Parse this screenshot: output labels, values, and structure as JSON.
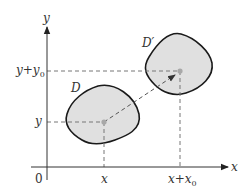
{
  "diagram": {
    "type": "translation-of-region",
    "axes": {
      "x_label": "x",
      "y_label": "y",
      "origin_label": "0"
    },
    "ticks": {
      "x": [
        "x",
        "x+x₀"
      ],
      "y": [
        "y",
        "y+y₀"
      ]
    },
    "regions": [
      {
        "label": "D",
        "center_label": "(x, y)"
      },
      {
        "label": "D′",
        "center_label": "(x+x₀, y+y₀)"
      }
    ],
    "arrow": {
      "from": "(x, y)",
      "to": "(x+x₀, y+y₀)",
      "style": "dashed"
    },
    "colors": {
      "region_fill": "#e0e0e0",
      "region_stroke": "#1a1a1a",
      "axis": "#333333",
      "dashed": "#777777",
      "point": "#a8a8a8"
    },
    "text": {
      "x_tick_1": "x",
      "x_tick_2_main": "x+x",
      "x_tick_2_sub": "0",
      "y_tick_1": "y",
      "y_tick_2_main": "y+y",
      "y_tick_2_sub": "0",
      "region_D": "D",
      "region_Dprime": "D′"
    }
  }
}
